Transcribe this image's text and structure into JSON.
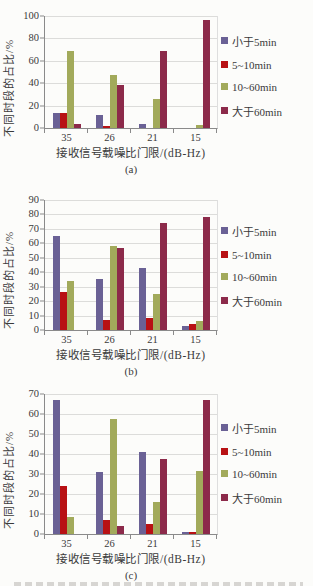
{
  "page": {
    "background": "#fcfcfa"
  },
  "colors": {
    "series": [
      "#6a6195",
      "#b81114",
      "#a2aa5b",
      "#8c2a4a"
    ],
    "axis": "#8a8a8a",
    "gridline": "#dcdcda",
    "text": "#3a3a3a"
  },
  "legend_labels": [
    "小于5min",
    "5~10min",
    "10~60min",
    "大于60min"
  ],
  "chart_data": [
    {
      "type": "bar",
      "label": "(a)",
      "ylabel": "不同时段的占比/%",
      "xlabel": "接收信号载噪比门限/(dB-Hz)",
      "categories": [
        "35",
        "26",
        "21",
        "15"
      ],
      "ylim": [
        0,
        100
      ],
      "ystep": 20,
      "grid": true,
      "legend_position": "right",
      "series": [
        {
          "name": "小于5min",
          "values": [
            13,
            12,
            4,
            0
          ]
        },
        {
          "name": "5~10min",
          "values": [
            13,
            2,
            0,
            0
          ]
        },
        {
          "name": "10~60min",
          "values": [
            69,
            47,
            26,
            3
          ]
        },
        {
          "name": "大于60min",
          "values": [
            4,
            38,
            69,
            96
          ]
        }
      ]
    },
    {
      "type": "bar",
      "label": "(b)",
      "ylabel": "不同时段的占比/%",
      "xlabel": "接收信号载噪比门限/(dB-Hz)",
      "categories": [
        "35",
        "26",
        "21",
        "15"
      ],
      "ylim": [
        0,
        90
      ],
      "ystep": 10,
      "grid": true,
      "legend_position": "right",
      "series": [
        {
          "name": "小于5min",
          "values": [
            65,
            35,
            43,
            3
          ]
        },
        {
          "name": "5~10min",
          "values": [
            26,
            7,
            8,
            4
          ]
        },
        {
          "name": "10~60min",
          "values": [
            34,
            58,
            25,
            6
          ]
        },
        {
          "name": "大于60min",
          "values": [
            0,
            57,
            74,
            78
          ]
        }
      ]
    },
    {
      "type": "bar",
      "label": "(c)",
      "ylabel": "不同时段的占比/%",
      "xlabel": "接收信号载噪比门限/(dB-Hz)",
      "categories": [
        "35",
        "26",
        "21",
        "15"
      ],
      "ylim": [
        0,
        70
      ],
      "ystep": 10,
      "grid": true,
      "legend_position": "right",
      "series": [
        {
          "name": "小于5min",
          "values": [
            67,
            31,
            41,
            1
          ]
        },
        {
          "name": "5~10min",
          "values": [
            24,
            7,
            5,
            1
          ]
        },
        {
          "name": "10~60min",
          "values": [
            8.5,
            57.5,
            16,
            31.5
          ]
        },
        {
          "name": "大于60min",
          "values": [
            0,
            4,
            37.5,
            67
          ]
        }
      ]
    }
  ]
}
